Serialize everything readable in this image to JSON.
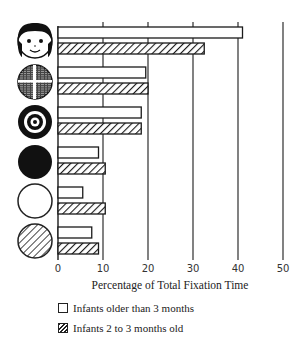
{
  "chart_data": {
    "type": "bar",
    "orientation": "horizontal",
    "title": "",
    "xlabel": "Percentage of Total Fixation Time",
    "ylabel": "",
    "xlim": [
      0,
      50
    ],
    "xticks": [
      0,
      10,
      20,
      30,
      40,
      50
    ],
    "grid": true,
    "legend_position": "bottom-left",
    "categories": [
      "face",
      "newsprint",
      "bullseye",
      "solid-black circle",
      "plain white circle",
      "striped circle"
    ],
    "category_icons": [
      "face-icon",
      "newsprint-icon",
      "bullseye-icon",
      "black-circle-icon",
      "white-circle-icon",
      "striped-circle-icon"
    ],
    "series": [
      {
        "name": "Infants older than 3 months",
        "pattern": "plain",
        "values": [
          41,
          19.5,
          18.5,
          9,
          5.5,
          7.5
        ]
      },
      {
        "name": "Infants 2 to 3 months old",
        "pattern": "hatched",
        "values": [
          32.5,
          20,
          18.5,
          10.5,
          10.5,
          9
        ]
      }
    ]
  },
  "legend": {
    "items": [
      {
        "label": "Infants older than 3 months",
        "pattern": "plain"
      },
      {
        "label": "Infants 2 to 3 months old",
        "pattern": "hatched"
      }
    ]
  },
  "colors": {
    "ink": "#1a1a1a",
    "background": "#ffffff"
  }
}
